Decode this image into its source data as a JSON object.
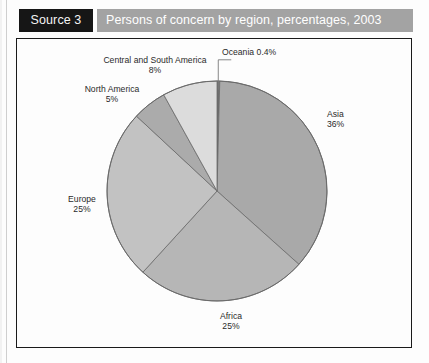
{
  "header": {
    "source_label": "Source 3",
    "title": "Persons of concern by region, percentages, 2003"
  },
  "chart_data": {
    "type": "pie",
    "title": "Persons of concern by region, percentages, 2003",
    "xlabel": "",
    "ylabel": "",
    "legend_position": "none",
    "grid": false,
    "unit": "percent",
    "start_angle_deg": 0,
    "direction": "clockwise",
    "categories": [
      "Oceania",
      "Asia",
      "Africa",
      "Europe",
      "North America",
      "Central and South America"
    ],
    "values": [
      0.4,
      36,
      25,
      25,
      5,
      8
    ],
    "slices": [
      {
        "name": "Oceania",
        "value": 0.4,
        "label_name": "Oceania",
        "label_pct": "0.4%",
        "label_text": "Oceania 0.4%",
        "color": "#6e6e6e",
        "has_leader_line": true
      },
      {
        "name": "Asia",
        "value": 36,
        "label_name": "Asia",
        "label_pct": "36%",
        "label_text": "Asia 36%",
        "color": "#a9a9a9",
        "has_leader_line": false
      },
      {
        "name": "Africa",
        "value": 25,
        "label_name": "Africa",
        "label_pct": "25%",
        "label_text": "Africa 25%",
        "color": "#b6b6b6",
        "has_leader_line": false
      },
      {
        "name": "Europe",
        "value": 25,
        "label_name": "Europe",
        "label_pct": "25%",
        "label_text": "Europe 25%",
        "color": "#c2c2c2",
        "has_leader_line": false
      },
      {
        "name": "North America",
        "value": 5,
        "label_name": "North America",
        "label_pct": "5%",
        "label_text": "North America 5%",
        "color": "#ababab",
        "has_leader_line": false
      },
      {
        "name": "Central and South America",
        "value": 8,
        "label_name": "Central and South America",
        "label_pct": "8%",
        "label_text": "Central and South America 8%",
        "color": "#dcdcdc",
        "has_leader_line": false
      }
    ]
  },
  "colors": {
    "source_badge_bg": "#161616",
    "title_bar_bg": "#a3a3a3",
    "title_text": "#ffffff",
    "frame_border": "#1a1a1a",
    "page_bg": "#fdfdfd",
    "slice_outline": "#6a6a6a",
    "label_text": "#2a2a2a"
  }
}
